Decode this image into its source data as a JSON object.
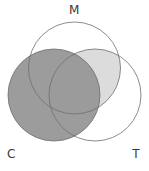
{
  "figure": {
    "title": "",
    "type": "venn-diagram-3-set",
    "background_color": "#ffffff"
  },
  "labels": {
    "m": "M",
    "c": "C",
    "t": "T"
  },
  "chart_data": {
    "type": "venn",
    "sets": [
      {
        "id": "M",
        "label": "M",
        "cx": 74.5,
        "cy": 68,
        "r": 46
      },
      {
        "id": "C",
        "label": "C",
        "cx": 54,
        "cy": 95,
        "r": 46
      },
      {
        "id": "T",
        "label": "T",
        "cx": 95,
        "cy": 95,
        "r": 46
      }
    ],
    "shaded_regions": [
      {
        "region": "C",
        "description": "entire C circle",
        "fill": "#999999"
      },
      {
        "region": "M and T",
        "description": "intersection of M and T",
        "fill": "#dcdcdc"
      }
    ],
    "stroke_color": "#6e6e6e",
    "stroke_width": 0.8,
    "label_color": "#3a3a3a"
  },
  "colors": {
    "dark_fill": "#999999",
    "light_fill": "#dcdcdc",
    "stroke": "#6e6e6e",
    "background": "#ffffff",
    "text": "#3a3a3a"
  }
}
